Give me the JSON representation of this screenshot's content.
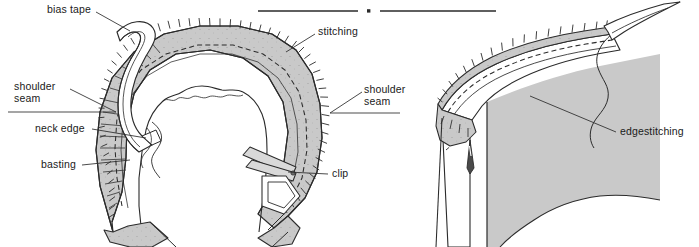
{
  "figure": {
    "background_color": "#ffffff",
    "ink_color": "#1a1a1a",
    "fabric_fill": "#c9c9c9",
    "tape_fill": "#d4d4d4",
    "divider": {
      "name": "section-divider",
      "dot_shape": "square",
      "x_start": 258,
      "x_end": 496,
      "y": 11
    }
  },
  "diagrams": [
    {
      "id": "left",
      "name": "neckline-bias-tape-diagram",
      "caption": "Neckline with bias tape basted to neck edge, stitched and clipped"
    },
    {
      "id": "right",
      "name": "edgestitching-detail-diagram",
      "caption": "Bias facing turned to inside and edgestitched"
    }
  ],
  "labels": [
    {
      "id": "bias-tape",
      "text": "bias tape",
      "x": 47,
      "y": 7,
      "align": "left",
      "lines": 1
    },
    {
      "id": "stitching",
      "text": "stitching",
      "x": 318,
      "y": 29,
      "align": "left",
      "lines": 1
    },
    {
      "id": "shoulder-seam-left",
      "text": "shoulder\nseam",
      "x": 18,
      "y": 82,
      "align": "left",
      "lines": 2
    },
    {
      "id": "shoulder-seam-right",
      "text": "shoulder\nseam",
      "x": 365,
      "y": 85,
      "align": "left",
      "lines": 2
    },
    {
      "id": "neck-edge",
      "text": "neck edge",
      "x": 36,
      "y": 124,
      "align": "left",
      "lines": 1
    },
    {
      "id": "basting",
      "text": "basting",
      "x": 42,
      "y": 161,
      "align": "left",
      "lines": 1
    },
    {
      "id": "clip",
      "text": "clip",
      "x": 331,
      "y": 170,
      "align": "left",
      "lines": 1
    },
    {
      "id": "edgestitching",
      "text": "edgestitching",
      "x": 619,
      "y": 127,
      "align": "left",
      "lines": 1
    }
  ]
}
